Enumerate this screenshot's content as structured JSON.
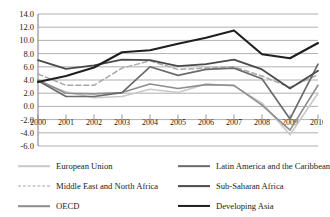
{
  "chart_data": {
    "type": "line",
    "title": "",
    "xlabel": "",
    "ylabel": "",
    "grid": true,
    "legend_position": "bottom",
    "categories": [
      "2000",
      "2001",
      "2002",
      "2003",
      "2004",
      "2005",
      "2006",
      "2007",
      "2008",
      "2009",
      "2010"
    ],
    "ylim": [
      -6.0,
      14.0
    ],
    "ytick_step": 2.0,
    "yticks": [
      "14.0",
      "12.0",
      "10.0",
      "8.0",
      "6.0",
      "4.0",
      "2.0",
      "0.0",
      "-2.0",
      "-4.0",
      "-6.0"
    ],
    "series": [
      {
        "name": "European Union",
        "color": "#c9c9c9",
        "style": "solid",
        "width": 1.6,
        "values": [
          3.9,
          2.2,
          1.3,
          1.5,
          2.6,
          2.1,
          3.4,
          3.1,
          0.5,
          -4.3,
          2.0
        ]
      },
      {
        "name": "Middle East and North Africa",
        "color": "#a8a8a8",
        "style": "dashed",
        "width": 1.5,
        "values": [
          4.9,
          3.2,
          3.2,
          5.8,
          6.9,
          5.6,
          5.8,
          6.0,
          4.6,
          2.9,
          4.8
        ]
      },
      {
        "name": "OECD",
        "color": "#8d8d8d",
        "style": "solid",
        "width": 1.6,
        "values": [
          4.0,
          2.0,
          1.9,
          2.1,
          3.4,
          2.7,
          3.3,
          3.2,
          0.2,
          -3.6,
          3.2
        ]
      },
      {
        "name": "Latin America and the Caribbean",
        "color": "#6b6b6b",
        "style": "solid",
        "width": 1.7,
        "values": [
          3.9,
          1.5,
          1.5,
          2.1,
          6.0,
          4.7,
          5.6,
          5.8,
          4.2,
          -1.9,
          6.4
        ]
      },
      {
        "name": "Sub-Saharan Africa",
        "color": "#4a4a4a",
        "style": "solid",
        "width": 1.8,
        "values": [
          7.0,
          5.7,
          6.2,
          7.1,
          7.0,
          6.1,
          6.4,
          7.1,
          5.6,
          2.7,
          5.4
        ]
      },
      {
        "name": "Developing Asia",
        "color": "#1f1f1f",
        "style": "solid",
        "width": 2.1,
        "values": [
          3.7,
          4.6,
          5.9,
          8.2,
          8.5,
          9.5,
          10.4,
          11.5,
          7.9,
          7.3,
          9.6
        ]
      }
    ]
  },
  "legend": {
    "left_column": [
      {
        "label": "European Union"
      },
      {
        "label": "Middle East and North Africa"
      },
      {
        "label": "OECD"
      }
    ],
    "right_column": [
      {
        "label": "Latin America and the Caribbean"
      },
      {
        "label": "Sub-Saharan Africa"
      },
      {
        "label": "Developing Asia"
      }
    ]
  },
  "axis_color": "#7a7a7a",
  "grid_color": "#9a9a9a"
}
